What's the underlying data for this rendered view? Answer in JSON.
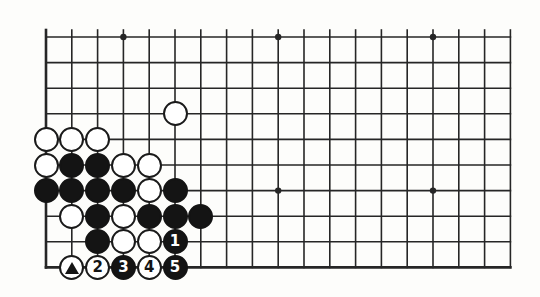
{
  "figure": {
    "kind": "go-board-diagram",
    "background_color": "#fdfdfb",
    "line_color": "#262626",
    "black_color": "#141414",
    "white_color": "#ffffff"
  },
  "board": {
    "columns": 19,
    "rows": 10,
    "origin_x": 46,
    "origin_y": 37,
    "spacing_x": 25.8,
    "spacing_y": 25.6,
    "edge_line_width": 2.6,
    "grid_line_width": 1.6,
    "star_point_radius": 3.2,
    "star_points": [
      {
        "col": 3,
        "row": 0
      },
      {
        "col": 9,
        "row": 0
      },
      {
        "col": 15,
        "row": 0
      },
      {
        "col": 9,
        "row": 6
      },
      {
        "col": 15,
        "row": 6
      }
    ],
    "edges": {
      "left": true,
      "bottom": true,
      "top": false,
      "right": false
    }
  },
  "stones": [
    {
      "name": "white-stone-c5r3",
      "col": 5,
      "row": 3,
      "color": "white",
      "label": "",
      "mark": ""
    },
    {
      "name": "white-stone-c0r4",
      "col": 0,
      "row": 4,
      "color": "white",
      "label": "",
      "mark": ""
    },
    {
      "name": "white-stone-c1r4",
      "col": 1,
      "row": 4,
      "color": "white",
      "label": "",
      "mark": ""
    },
    {
      "name": "white-stone-c2r4",
      "col": 2,
      "row": 4,
      "color": "white",
      "label": "",
      "mark": ""
    },
    {
      "name": "white-stone-c0r5",
      "col": 0,
      "row": 5,
      "color": "white",
      "label": "",
      "mark": ""
    },
    {
      "name": "black-stone-c1r5",
      "col": 1,
      "row": 5,
      "color": "black",
      "label": "",
      "mark": ""
    },
    {
      "name": "black-stone-c2r5",
      "col": 2,
      "row": 5,
      "color": "black",
      "label": "",
      "mark": ""
    },
    {
      "name": "white-stone-c3r5",
      "col": 3,
      "row": 5,
      "color": "white",
      "label": "",
      "mark": ""
    },
    {
      "name": "white-stone-c4r5",
      "col": 4,
      "row": 5,
      "color": "white",
      "label": "",
      "mark": ""
    },
    {
      "name": "black-stone-c0r6",
      "col": 0,
      "row": 6,
      "color": "black",
      "label": "",
      "mark": ""
    },
    {
      "name": "black-stone-c1r6",
      "col": 1,
      "row": 6,
      "color": "black",
      "label": "",
      "mark": ""
    },
    {
      "name": "black-stone-c2r6",
      "col": 2,
      "row": 6,
      "color": "black",
      "label": "",
      "mark": ""
    },
    {
      "name": "black-stone-c3r6",
      "col": 3,
      "row": 6,
      "color": "black",
      "label": "",
      "mark": ""
    },
    {
      "name": "white-stone-c4r6",
      "col": 4,
      "row": 6,
      "color": "white",
      "label": "",
      "mark": ""
    },
    {
      "name": "black-stone-c5r6",
      "col": 5,
      "row": 6,
      "color": "black",
      "label": "",
      "mark": ""
    },
    {
      "name": "white-stone-c1r7",
      "col": 1,
      "row": 7,
      "color": "white",
      "label": "",
      "mark": ""
    },
    {
      "name": "black-stone-c2r7",
      "col": 2,
      "row": 7,
      "color": "black",
      "label": "",
      "mark": ""
    },
    {
      "name": "white-stone-c3r7",
      "col": 3,
      "row": 7,
      "color": "white",
      "label": "",
      "mark": ""
    },
    {
      "name": "black-stone-c4r7",
      "col": 4,
      "row": 7,
      "color": "black",
      "label": "",
      "mark": ""
    },
    {
      "name": "black-stone-c5r7",
      "col": 5,
      "row": 7,
      "color": "black",
      "label": "",
      "mark": ""
    },
    {
      "name": "black-stone-c6r7",
      "col": 6,
      "row": 7,
      "color": "black",
      "label": "",
      "mark": ""
    },
    {
      "name": "black-stone-c2r8",
      "col": 2,
      "row": 8,
      "color": "black",
      "label": "",
      "mark": ""
    },
    {
      "name": "white-stone-c3r8",
      "col": 3,
      "row": 8,
      "color": "white",
      "label": "",
      "mark": ""
    },
    {
      "name": "white-stone-c4r8",
      "col": 4,
      "row": 8,
      "color": "white",
      "label": "",
      "mark": ""
    },
    {
      "name": "black-stone-move-1",
      "col": 5,
      "row": 8,
      "color": "black",
      "label": "1",
      "mark": ""
    },
    {
      "name": "white-stone-triangle",
      "col": 1,
      "row": 9,
      "color": "white",
      "label": "",
      "mark": "triangle"
    },
    {
      "name": "white-stone-move-2",
      "col": 2,
      "row": 9,
      "color": "white",
      "label": "2",
      "mark": ""
    },
    {
      "name": "black-stone-move-3",
      "col": 3,
      "row": 9,
      "color": "black",
      "label": "3",
      "mark": ""
    },
    {
      "name": "white-stone-move-4",
      "col": 4,
      "row": 9,
      "color": "white",
      "label": "4",
      "mark": ""
    },
    {
      "name": "black-stone-move-5",
      "col": 5,
      "row": 9,
      "color": "black",
      "label": "5",
      "mark": ""
    }
  ],
  "move_sequence": [
    "1",
    "2",
    "3",
    "4",
    "5"
  ],
  "stone_diameter": 25
}
